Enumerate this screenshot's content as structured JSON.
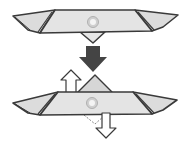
{
  "diagram": {
    "type": "origami-fold-instruction",
    "steps": [
      {
        "name": "before-fold",
        "description": "folded paper model, top view"
      },
      {
        "name": "after-fold",
        "description": "center flap pulled up and pushed down"
      }
    ],
    "arrows": [
      {
        "name": "transition-arrow",
        "style": "solid-dark",
        "direction": "down"
      },
      {
        "name": "pull-up-arrow",
        "style": "hollow-outline",
        "direction": "up"
      },
      {
        "name": "push-down-arrow",
        "style": "hollow-outline",
        "direction": "down"
      }
    ],
    "colors": {
      "paper_fill": "#dcdcdc",
      "paper_light": "#e9e9e9",
      "outline": "#3a3a3a",
      "arrow_dark": "#444444",
      "arrow_hollow_fill": "#ffffff",
      "marker": "#f2f2f2",
      "background": "#ffffff"
    }
  }
}
